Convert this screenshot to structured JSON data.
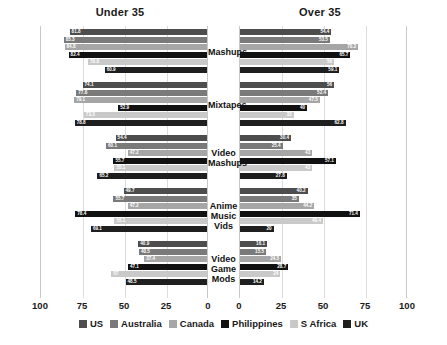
{
  "panels": {
    "left_title": "Under 35",
    "right_title": "Over 35"
  },
  "axis": {
    "left_ticks": [
      "100",
      "75",
      "50",
      "25",
      "0"
    ],
    "right_ticks": [
      "0",
      "25",
      "50",
      "75",
      "100"
    ]
  },
  "legend": {
    "items": [
      {
        "label": "US",
        "color": "#4d4d4d"
      },
      {
        "label": "Australia",
        "color": "#7a7a7a"
      },
      {
        "label": "Canada",
        "color": "#a6a6a6"
      },
      {
        "label": "Philippines",
        "color": "#111111"
      },
      {
        "label": "S Africa",
        "color": "#c9c9c9"
      },
      {
        "label": "UK",
        "color": "#1f1f1f"
      }
    ]
  },
  "chart_data": {
    "type": "bar",
    "title": "",
    "subtype": "back-to-back horizontal bar",
    "xlabel": "",
    "ylabel": "",
    "xlim": [
      0,
      100
    ],
    "grid": true,
    "legend_position": "bottom",
    "categories": [
      "Mashups",
      "Mixtapes",
      "Video Mashups",
      "Anime Music Vids",
      "Video Game Mods"
    ],
    "category_lines": [
      [
        "Mashups"
      ],
      [
        "Mixtapes"
      ],
      [
        "Video",
        "Mashups"
      ],
      [
        "Anime",
        "Music Vids"
      ],
      [
        "Video Game",
        "Mods"
      ]
    ],
    "panels": [
      "Under 35",
      "Over 35"
    ],
    "series": [
      {
        "name": "US",
        "color": "#4d4d4d",
        "under35": [
          81.8,
          74.1,
          54.4,
          49.7,
          40.9
        ],
        "over35": [
          54.4,
          56.0,
          30.4,
          40.2,
          16.1
        ]
      },
      {
        "name": "Australia",
        "color": "#7a7a7a",
        "under35": [
          85.3,
          77.8,
          60.1,
          55.7,
          40.5
        ],
        "over35": [
          53.5,
          52.4,
          25.4,
          35.0,
          15.5
        ]
      },
      {
        "name": "Canada",
        "color": "#a6a6a6",
        "under35": [
          84.8,
          79.1,
          47.2,
          47.2,
          37.4
        ],
        "over35": [
          70.3,
          47.5,
          43.0,
          44.2,
          24.5
        ]
      },
      {
        "name": "Philippines",
        "color": "#111111",
        "under35": [
          82.4,
          52.9,
          55.7,
          78.4,
          47.1
        ],
        "over35": [
          65.7,
          40.0,
          57.1,
          71.4,
          28.7
        ]
      },
      {
        "name": "S Africa",
        "color": "#c9c9c9",
        "under35": [
          70.8,
          73.3,
          55.1,
          55.1,
          57.0
        ],
        "over35": [
          56.0,
          32.0,
          43.0,
          49.4,
          24.0
        ]
      },
      {
        "name": "UK",
        "color": "#1f1f1f",
        "under35": [
          60.9,
          78.8,
          65.2,
          69.1,
          48.5
        ],
        "over35": [
          59.1,
          62.8,
          27.8,
          20.0,
          14.2
        ]
      }
    ]
  }
}
